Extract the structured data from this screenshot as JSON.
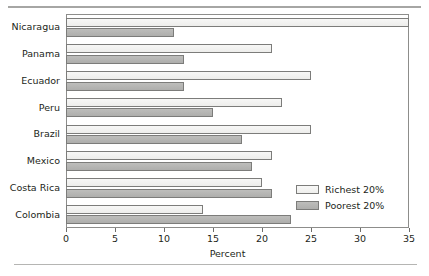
{
  "chart_data": {
    "type": "bar",
    "orientation": "horizontal",
    "title": "",
    "xlabel": "Percent",
    "ylabel": "",
    "xlim": [
      0,
      35
    ],
    "xticks": [
      0,
      5,
      10,
      15,
      20,
      25,
      30,
      35
    ],
    "grid": false,
    "legend_position": "inside-bottom-right",
    "categories": [
      "Nicaragua",
      "Panama",
      "Ecuador",
      "Peru",
      "Brazil",
      "Mexico",
      "Costa Rica",
      "Colombia"
    ],
    "series": [
      {
        "name": "Richest 20%",
        "color": "#f2f2f0",
        "values": [
          35,
          21,
          25,
          22,
          25,
          21,
          20,
          14
        ]
      },
      {
        "name": "Poorest 20%",
        "color": "#b4b4b2",
        "values": [
          11,
          12,
          12,
          15,
          18,
          19,
          21,
          23
        ]
      }
    ]
  },
  "legend": {
    "items": [
      {
        "label": "Richest 20%",
        "swatch": "rich"
      },
      {
        "label": "Poorest 20%",
        "swatch": "poor"
      }
    ]
  }
}
